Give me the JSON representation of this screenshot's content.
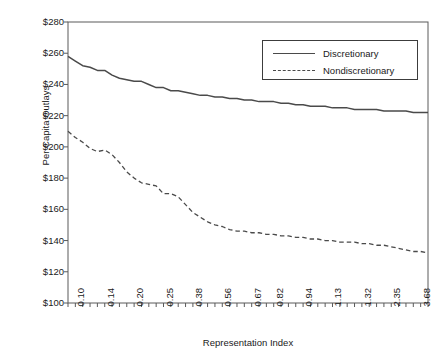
{
  "caption_remnant": "",
  "legend": {
    "position": "upper-right",
    "entries": [
      {
        "label": "Discretionary",
        "style": "solid",
        "swatch": "solid-line-swatch"
      },
      {
        "label": "Nondiscretionary",
        "style": "dashed",
        "swatch": "dashed-line-swatch"
      }
    ]
  },
  "chart_data": {
    "type": "line",
    "title": "",
    "xlabel": "Representation Index",
    "ylabel": "Per Capita Outlays",
    "grid": false,
    "legend_position": "upper right",
    "ylim": [
      100,
      280
    ],
    "ytick_labels": [
      "$280",
      "$260",
      "$240",
      "$220",
      "$200",
      "$180",
      "$160",
      "$140",
      "$120",
      "$100"
    ],
    "ytick_values": [
      280,
      260,
      240,
      220,
      200,
      180,
      160,
      140,
      120,
      100
    ],
    "x_axis_type": "categorical-ordinal",
    "xtick_labels": [
      "0.10",
      "0.14",
      "0.20",
      "0.25",
      "0.38",
      "0.56",
      "0.67",
      "0.82",
      "0.94",
      "1.13",
      "1.32",
      "2.35",
      "3.68"
    ],
    "minor_tick_count": 49,
    "series": [
      {
        "name": "Discretionary",
        "style": "solid",
        "color": "#4a4a4a",
        "values": [
          258,
          255,
          252,
          251,
          249,
          249,
          246,
          244,
          243,
          242,
          242,
          240,
          238,
          238,
          236,
          236,
          235,
          234,
          233,
          233,
          232,
          232,
          231,
          231,
          230,
          230,
          229,
          229,
          229,
          228,
          228,
          227,
          227,
          226,
          226,
          226,
          225,
          225,
          225,
          224,
          224,
          224,
          224,
          223,
          223,
          223,
          223,
          222,
          222,
          222
        ]
      },
      {
        "name": "Nondiscretionary",
        "style": "dashed",
        "color": "#4a4a4a",
        "values": [
          210,
          206,
          203,
          199,
          197,
          198,
          195,
          190,
          184,
          180,
          177,
          176,
          175,
          170,
          170,
          168,
          163,
          158,
          155,
          152,
          150,
          149,
          147,
          146,
          146,
          145,
          145,
          144,
          144,
          143,
          143,
          142,
          142,
          141,
          141,
          140,
          140,
          139,
          139,
          139,
          138,
          138,
          137,
          137,
          136,
          135,
          134,
          133,
          133,
          132
        ]
      }
    ]
  }
}
